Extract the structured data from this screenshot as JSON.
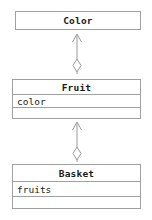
{
  "diagram": {
    "kind": "uml-class-diagram",
    "classes": [
      {
        "id": "color",
        "name": "Color",
        "attributes": [],
        "operations": [],
        "compartments": 1
      },
      {
        "id": "fruit",
        "name": "Fruit",
        "attributes": [
          "color"
        ],
        "operations": [
          ""
        ],
        "compartments": 3
      },
      {
        "id": "basket",
        "name": "Basket",
        "attributes": [
          "fruits"
        ],
        "operations": [
          ""
        ],
        "compartments": 3
      }
    ],
    "relationships": [
      {
        "id": "fruit-color",
        "from": "Fruit",
        "to": "Color",
        "type": "aggregation",
        "source_decoration": "hollow-diamond",
        "target_decoration": "open-arrowhead",
        "label": ""
      },
      {
        "id": "basket-fruit",
        "from": "Basket",
        "to": "Fruit",
        "type": "aggregation",
        "source_decoration": "hollow-diamond",
        "target_decoration": "open-arrowhead",
        "label": ""
      }
    ],
    "colors": {
      "background": "#ffffff",
      "border": "#a0a0a0",
      "connector": "#9a9a9a",
      "text": "#1a1a1a"
    }
  }
}
